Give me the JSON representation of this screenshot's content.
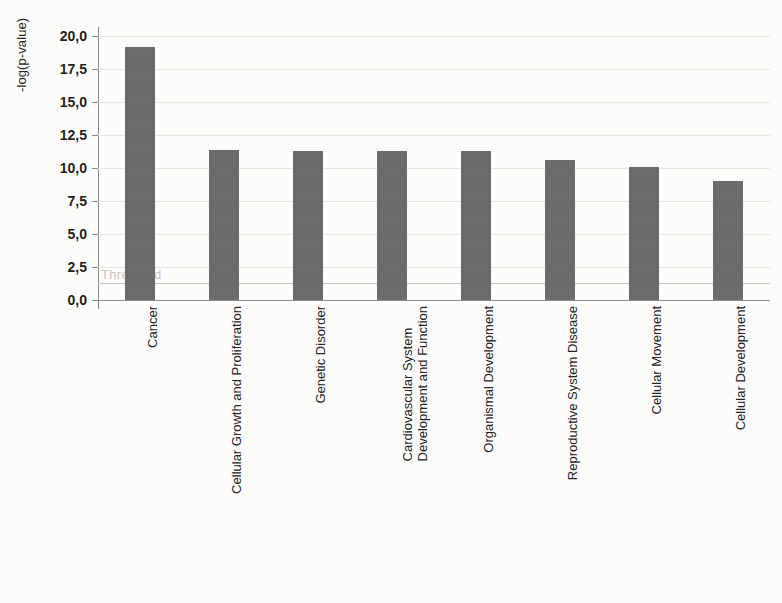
{
  "chart_data": {
    "type": "bar",
    "title": "",
    "xlabel": "",
    "ylabel": "-log(p-value)",
    "ylim": [
      0,
      20
    ],
    "ytick_labels": [
      "20,0",
      "17,5",
      "15,0",
      "12,5",
      "10,0",
      "7,5",
      "5,0",
      "2,5",
      "0,0"
    ],
    "ytick_values": [
      20.0,
      17.5,
      15.0,
      12.5,
      10.0,
      7.5,
      5.0,
      2.5,
      0.0
    ],
    "grid": true,
    "legend": "none",
    "decimal_separator": ",",
    "bar_color": "#6b6b6b",
    "categories": [
      "Cancer",
      "Cellular Growth and Proliferation",
      "Genetic Disorder",
      "Cardiovascular System Development and Function",
      "Organismal Development",
      "Reproductive System Disease",
      "Cellular Movement",
      "Cellular Development"
    ],
    "category_lines": [
      [
        "Cancer"
      ],
      [
        "Cellular Growth and Proliferation"
      ],
      [
        "Genetic Disorder"
      ],
      [
        "Cardiovascular System",
        "Development and Function"
      ],
      [
        "Organismal Development"
      ],
      [
        "Reproductive System Disease"
      ],
      [
        "Cellular Movement"
      ],
      [
        "Cellular Development"
      ]
    ],
    "values": [
      19.2,
      11.4,
      11.3,
      11.3,
      11.3,
      10.6,
      10.1,
      9.0
    ],
    "annotations": [
      {
        "name": "threshold",
        "label": "Threshold",
        "value": 1.3,
        "color": "#c9c6c1"
      }
    ]
  }
}
